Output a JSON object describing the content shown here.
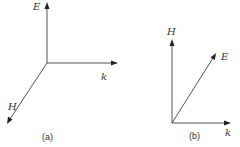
{
  "diagrams": [
    {
      "caption": "(a)",
      "vectors": [
        {
          "label": "E",
          "direction": "up"
        },
        {
          "label": "k",
          "direction": "right"
        },
        {
          "label": "H",
          "direction": "down-left"
        }
      ]
    },
    {
      "caption": "(b)",
      "vectors": [
        {
          "label": "H",
          "direction": "up"
        },
        {
          "label": "E",
          "direction": "up-right"
        },
        {
          "label": "k",
          "direction": "right"
        }
      ]
    }
  ],
  "colors": {
    "line": "#555555",
    "arrowhead": "#222222",
    "text": "#333333"
  }
}
